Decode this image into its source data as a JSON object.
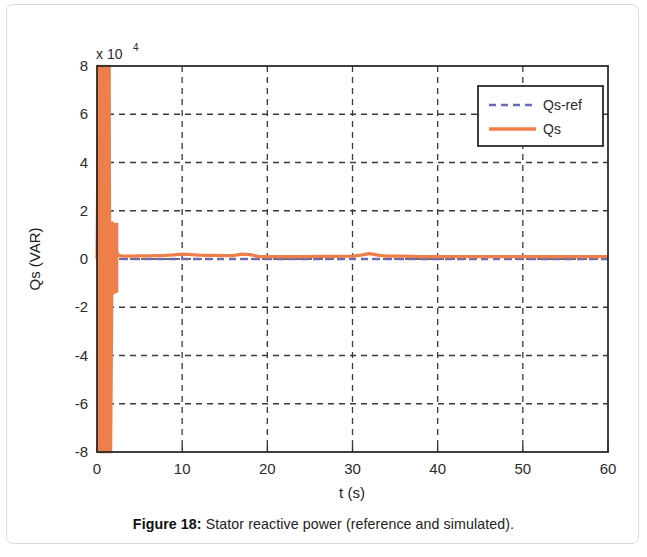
{
  "figure": {
    "caption_label": "Figure 18:",
    "caption_text": " Stator reactive power (reference and simulated)."
  },
  "colors": {
    "qs": "#ef7f4a",
    "qs_ref": "#6b6bb5",
    "axis": "#2b2b2b",
    "grid": "#3a3a3a",
    "page_border": "#dcdcdc",
    "background": "#ffffff"
  },
  "chart_data": {
    "type": "line",
    "title": "",
    "subtitle": "",
    "xlabel": "t (s)",
    "ylabel": "Qs (VAR)",
    "y_multiplier_label": "x 10",
    "y_multiplier_exponent": "4",
    "y_multiplier_value": 10000,
    "xlim": [
      0,
      60
    ],
    "ylim": [
      -8,
      8
    ],
    "xticks": [
      0,
      10,
      20,
      30,
      40,
      50,
      60
    ],
    "xtick_labels": [
      "0",
      "10",
      "20",
      "30",
      "40",
      "50",
      "60"
    ],
    "yticks": [
      -8,
      -6,
      -4,
      -2,
      0,
      2,
      4,
      6,
      8
    ],
    "ytick_labels": [
      "-8",
      "-6",
      "-4",
      "-2",
      "0",
      "2",
      "4",
      "6",
      "8"
    ],
    "grid": true,
    "grid_style": "dashed",
    "legend_position": "top-right",
    "legend": [
      "Qs-ref",
      "Qs"
    ],
    "series": [
      {
        "name": "Qs-ref",
        "style": "dashed",
        "color": "#6b6bb5",
        "units": "x 10^4 VAR",
        "description": "Reference stator reactive power held at zero for the whole run.",
        "x": [
          0,
          1,
          2,
          5,
          10,
          15,
          20,
          25,
          30,
          35,
          40,
          45,
          50,
          55,
          60
        ],
        "values": [
          0,
          0,
          0,
          0,
          0,
          0,
          0,
          0,
          0,
          0,
          0,
          0,
          0,
          0,
          0
        ]
      },
      {
        "name": "Qs",
        "style": "solid",
        "color": "#ef7f4a",
        "units": "x 10^4 VAR",
        "description": "Simulated stator reactive power: large saturated oscillation between -8 and +8 (x10^4 VAR) during the initial transient from t=0 to about t=1.6 s, decaying by t=2.5 s, then tracking the zero reference with a small positive offset of roughly 0.1 to 0.2 (x10^4 VAR) and light ripple for the remainder of the 60 s run.",
        "transient": {
          "t_start": 0,
          "t_end": 1.6,
          "amplitude_min": -8,
          "amplitude_max": 8,
          "decay_t_end": 2.5,
          "decay_amplitude_min": -1.4,
          "decay_amplitude_max": 1.5
        },
        "x": [
          0,
          0.2,
          0.4,
          0.6,
          0.8,
          1.0,
          1.2,
          1.4,
          1.6,
          1.8,
          2.0,
          2.2,
          2.5,
          3,
          4,
          5,
          6,
          7,
          8,
          9,
          10,
          11,
          12,
          13,
          14,
          15,
          16,
          17,
          18,
          19,
          20,
          22,
          24,
          26,
          28,
          30,
          31,
          32,
          33,
          34,
          36,
          38,
          40,
          42,
          44,
          46,
          48,
          50,
          52,
          54,
          56,
          58,
          60
        ],
        "values": [
          0,
          8,
          -8,
          8,
          -8,
          8,
          -8,
          8,
          -8,
          1.5,
          -1.4,
          0.4,
          0.15,
          0.12,
          0.12,
          0.13,
          0.13,
          0.14,
          0.15,
          0.17,
          0.2,
          0.18,
          0.16,
          0.15,
          0.15,
          0.14,
          0.14,
          0.2,
          0.18,
          0.1,
          0.1,
          0.1,
          0.1,
          0.11,
          0.11,
          0.12,
          0.16,
          0.22,
          0.16,
          0.12,
          0.12,
          0.1,
          0.1,
          0.1,
          0.1,
          0.1,
          0.1,
          0.1,
          0.1,
          0.1,
          0.1,
          0.1,
          0.1
        ]
      }
    ]
  }
}
